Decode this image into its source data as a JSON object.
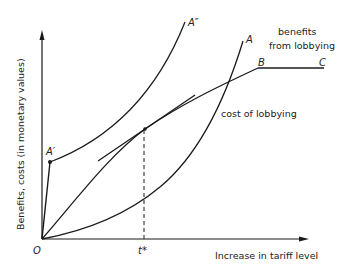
{
  "figure": {
    "y_axis_label": "Benefits, costs (in monetary values)",
    "x_axis_label": "Increase in tariff level",
    "origin_label": "O",
    "t_star_label": "t*",
    "curve_labels": {
      "a_double_prime": "A″",
      "a": "A",
      "a_prime": "A′",
      "b": "B",
      "c": "C"
    },
    "annotations": {
      "benefits_line1": "benefits",
      "benefits_line2": "from lobbying",
      "cost": "cost of lobbying"
    },
    "colors": {
      "line": "#1a1a1a",
      "text": "#222222",
      "background": "#ffffff"
    }
  }
}
